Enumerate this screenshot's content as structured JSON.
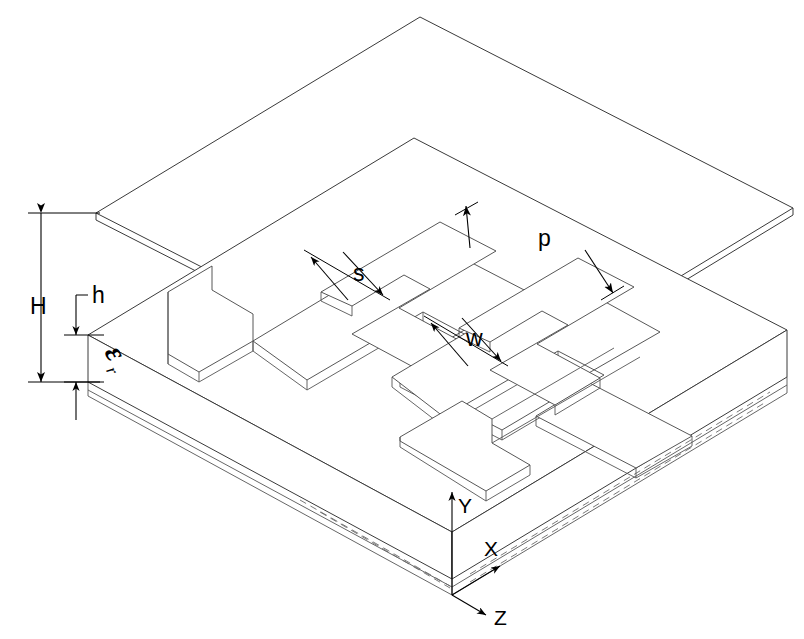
{
  "figure": {
    "type": "isometric-technical-drawing",
    "background_color": "#ffffff",
    "line_color": "#3a3a3a"
  },
  "dimensions": {
    "H": {
      "label": "H",
      "meaning": "total height from substrate top face to the suspended upper plate"
    },
    "h": {
      "label": "h",
      "meaning": "substrate thickness"
    },
    "p": {
      "label": "p",
      "meaning": "meander pitch / period"
    },
    "s": {
      "label": "s",
      "meaning": "gap spacing between adjacent conductor strips"
    },
    "w": {
      "label": "w",
      "meaning": "conductor strip width"
    }
  },
  "material": {
    "epsilon_symbol": "ε",
    "epsilon_subscript": "r",
    "label": "εr",
    "meaning": "relative permittivity of the substrate"
  },
  "axes": {
    "x": "X",
    "y": "Y",
    "z": "Z",
    "origin_note": "front-bottom corner of the substrate"
  },
  "parts": {
    "top_plate": "suspended upper conducting plate",
    "substrate": "dielectric substrate slab",
    "trace": "meander / spiral metal trace",
    "pad_left": "left feed pad",
    "pad_right": "right feed pad"
  }
}
